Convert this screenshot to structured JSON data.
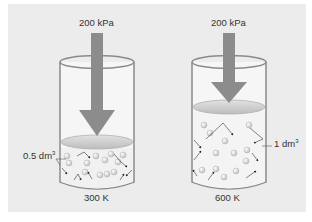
{
  "diagram": {
    "colors": {
      "background": "#ececec",
      "cylinder_outline": "#8a8a8a",
      "cylinder_fill": "#f6f6f6",
      "piston": "#c9c9c9",
      "arrow": "#8c8c8c",
      "particle": "#d8d8d8",
      "motion_line": "#333333"
    },
    "cylinders": [
      {
        "id": "left",
        "pressure_label": "200 kPa",
        "volume_label_value": "0.5 dm",
        "volume_label_exponent": "3",
        "temperature_label": "300 K",
        "volume_label_side": "left"
      },
      {
        "id": "right",
        "pressure_label": "200 kPa",
        "volume_label_value": "1 dm",
        "volume_label_exponent": "3",
        "temperature_label": "600 K",
        "volume_label_side": "right"
      }
    ]
  }
}
